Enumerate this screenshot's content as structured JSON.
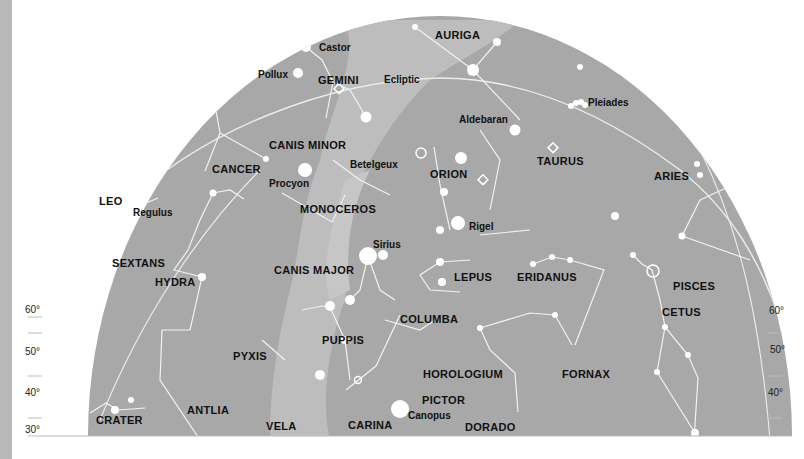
{
  "map": {
    "type": "star-chart",
    "colors": {
      "sky": "#a8a8a8",
      "milky_way": "#bdbdbd",
      "star": "#ffffff",
      "line": "#f2f2f2",
      "text": "#111111"
    },
    "ecliptic_label": "Ecliptic",
    "scale_left": [
      "60°",
      "50°",
      "40°",
      "30°"
    ],
    "scale_right": [
      "60°",
      "50°",
      "40°"
    ],
    "constellations": [
      "AURIGA",
      "GEMINI",
      "CANIS MINOR",
      "CANCER",
      "LEO",
      "MONOCEROS",
      "ORION",
      "TAURUS",
      "ARIES",
      "SEXTANS",
      "HYDRA",
      "CANIS MAJOR",
      "LEPUS",
      "ERIDANUS",
      "PISCES",
      "CETUS",
      "COLUMBA",
      "PUPPIS",
      "PYXIS",
      "HOROLOGIUM",
      "FORNAX",
      "ANTLIA",
      "CRATER",
      "PICTOR",
      "VELA",
      "CARINA",
      "DORADO"
    ],
    "stars": [
      "Castor",
      "Pollux",
      "Aldebaran",
      "Pleiades",
      "Betelgeux",
      "Procyon",
      "Regulus",
      "Rigel",
      "Sirius",
      "Canopus"
    ]
  }
}
